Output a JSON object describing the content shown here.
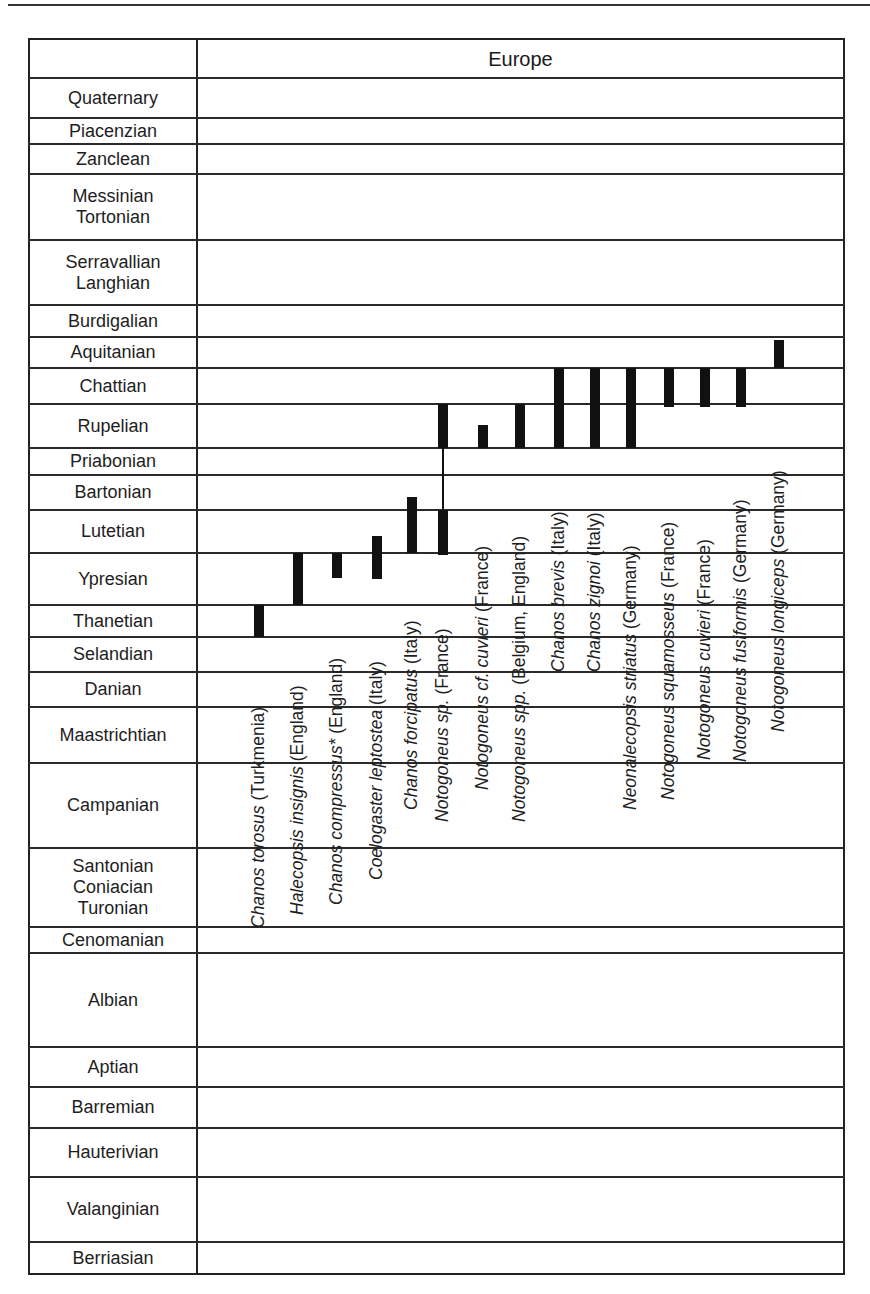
{
  "header": {
    "column_title": "Europe"
  },
  "chart_data": {
    "type": "range-chart",
    "title": "Europe",
    "xlabel": "",
    "ylabel": "Geological stage",
    "region": "Europe",
    "stages": [
      {
        "label": "Quaternary",
        "lines": [
          "Quaternary"
        ],
        "top": 78,
        "bottom": 118
      },
      {
        "label": "Piacenzian",
        "lines": [
          "Piacenzian"
        ],
        "top": 118,
        "bottom": 144
      },
      {
        "label": "Zanclean",
        "lines": [
          "Zanclean"
        ],
        "top": 144,
        "bottom": 174
      },
      {
        "label": "Messinian Tortonian",
        "lines": [
          "Messinian",
          "Tortonian"
        ],
        "top": 174,
        "bottom": 240
      },
      {
        "label": "Serravallian Langhian",
        "lines": [
          "Serravallian",
          "Langhian"
        ],
        "top": 240,
        "bottom": 305
      },
      {
        "label": "Burdigalian",
        "lines": [
          "Burdigalian"
        ],
        "top": 305,
        "bottom": 337
      },
      {
        "label": "Aquitanian",
        "lines": [
          "Aquitanian"
        ],
        "top": 337,
        "bottom": 368
      },
      {
        "label": "Chattian",
        "lines": [
          "Chattian"
        ],
        "top": 368,
        "bottom": 404
      },
      {
        "label": "Rupelian",
        "lines": [
          "Rupelian"
        ],
        "top": 404,
        "bottom": 448
      },
      {
        "label": "Priabonian",
        "lines": [
          "Priabonian"
        ],
        "top": 448,
        "bottom": 475
      },
      {
        "label": "Bartonian",
        "lines": [
          "Bartonian"
        ],
        "top": 475,
        "bottom": 510
      },
      {
        "label": "Lutetian",
        "lines": [
          "Lutetian"
        ],
        "top": 510,
        "bottom": 553
      },
      {
        "label": "Ypresian",
        "lines": [
          "Ypresian"
        ],
        "top": 553,
        "bottom": 605
      },
      {
        "label": "Thanetian",
        "lines": [
          "Thanetian"
        ],
        "top": 605,
        "bottom": 637
      },
      {
        "label": "Selandian",
        "lines": [
          "Selandian"
        ],
        "top": 637,
        "bottom": 672
      },
      {
        "label": "Danian",
        "lines": [
          "Danian"
        ],
        "top": 672,
        "bottom": 707
      },
      {
        "label": "Maastrichtian",
        "lines": [
          "Maastrichtian"
        ],
        "top": 707,
        "bottom": 763
      },
      {
        "label": "Campanian",
        "lines": [
          "Campanian"
        ],
        "top": 763,
        "bottom": 848
      },
      {
        "label": "Santonian Coniacian Turonian",
        "lines": [
          "Santonian",
          "Coniacian",
          "Turonian"
        ],
        "top": 848,
        "bottom": 927
      },
      {
        "label": "Cenomanian",
        "lines": [
          "Cenomanian"
        ],
        "top": 927,
        "bottom": 953
      },
      {
        "label": "Albian",
        "lines": [
          "Albian"
        ],
        "top": 953,
        "bottom": 1047
      },
      {
        "label": "Aptian",
        "lines": [
          "Aptian"
        ],
        "top": 1047,
        "bottom": 1087
      },
      {
        "label": "Barremian",
        "lines": [
          "Barremian"
        ],
        "top": 1087,
        "bottom": 1128
      },
      {
        "label": "Hauterivian",
        "lines": [
          "Hauterivian"
        ],
        "top": 1128,
        "bottom": 1177
      },
      {
        "label": "Valanginian",
        "lines": [
          "Valanginian"
        ],
        "top": 1177,
        "bottom": 1242
      },
      {
        "label": "Berriasian",
        "lines": [
          "Berriasian"
        ],
        "top": 1242,
        "bottom": 1275
      }
    ],
    "series": [
      {
        "name": "Chanos torosus",
        "locality": "(Turkmenia)",
        "range": [
          "Thanetian",
          "Thanetian"
        ],
        "x": 259,
        "segments": [
          [
            605,
            637
          ]
        ],
        "label_bottom": 928
      },
      {
        "name": "Halecopsis insignis",
        "locality": "(England)",
        "range": [
          "Ypresian",
          "Ypresian"
        ],
        "x": 298,
        "segments": [
          [
            553,
            605
          ]
        ],
        "label_bottom": 915
      },
      {
        "name": "Chanos compressus*",
        "locality": "(England)",
        "range": [
          "Ypresian (upper)",
          "Ypresian (upper)"
        ],
        "x": 337,
        "segments": [
          [
            553,
            578
          ]
        ],
        "label_bottom": 905
      },
      {
        "name": "Coelogaster leptostea",
        "locality": "(Italy)",
        "range": [
          "Ypresian",
          "Lutetian (basal)"
        ],
        "x": 377,
        "segments": [
          [
            536,
            579
          ]
        ],
        "label_bottom": 880
      },
      {
        "name": "Chanos forcipatus",
        "locality": "(Italy)",
        "range": [
          "Lutetian",
          "Bartonian (basal)"
        ],
        "x": 412,
        "segments": [
          [
            497,
            553
          ]
        ],
        "label_bottom": 810
      },
      {
        "name": "Notogoneus sp.",
        "locality": "(France)",
        "range": [
          "Lutetian",
          "Rupelian"
        ],
        "x": 443,
        "segments": [
          [
            404,
            448
          ],
          [
            510,
            555
          ]
        ],
        "connector": [
          448,
          510
        ],
        "label_bottom": 822
      },
      {
        "name": "Notogoneus cf. cuvieri",
        "locality": "(France)",
        "range": [
          "Rupelian (lower)",
          "Rupelian (lower)"
        ],
        "x": 483,
        "segments": [
          [
            425,
            448
          ]
        ],
        "label_bottom": 790
      },
      {
        "name": "Notogoneus spp.",
        "locality": "(Belgium, England)",
        "range": [
          "Rupelian",
          "Rupelian"
        ],
        "x": 520,
        "segments": [
          [
            404,
            448
          ]
        ],
        "label_bottom": 822
      },
      {
        "name": "Chanos brevis",
        "locality": "(Italy)",
        "range": [
          "Rupelian",
          "Chattian"
        ],
        "x": 559,
        "segments": [
          [
            368,
            448
          ]
        ],
        "label_bottom": 672
      },
      {
        "name": "Chanos zignoi",
        "locality": "(Italy)",
        "range": [
          "Rupelian",
          "Chattian"
        ],
        "x": 595,
        "segments": [
          [
            368,
            448
          ]
        ],
        "label_bottom": 672
      },
      {
        "name": "Neonalecopsis striatus",
        "locality": "(Germany)",
        "range": [
          "Rupelian",
          "Chattian"
        ],
        "x": 631,
        "segments": [
          [
            368,
            448
          ]
        ],
        "label_bottom": 810
      },
      {
        "name": "Notogoneus squamosseus",
        "locality": "(France)",
        "range": [
          "Chattian",
          "Chattian"
        ],
        "x": 669,
        "segments": [
          [
            368,
            407
          ]
        ],
        "label_bottom": 800
      },
      {
        "name": "Notogoneus cuvieri",
        "locality": "(France)",
        "range": [
          "Chattian",
          "Chattian"
        ],
        "x": 705,
        "segments": [
          [
            368,
            407
          ]
        ],
        "label_bottom": 760
      },
      {
        "name": "Notogoneus fusiformis",
        "locality": "(Germany)",
        "range": [
          "Chattian",
          "Chattian"
        ],
        "x": 741,
        "segments": [
          [
            368,
            407
          ]
        ],
        "label_bottom": 762
      },
      {
        "name": "Notogoneus longiceps",
        "locality": "(Germany)",
        "range": [
          "Aquitanian",
          "Aquitanian"
        ],
        "x": 779,
        "segments": [
          [
            340,
            368
          ]
        ],
        "label_bottom": 732
      }
    ],
    "legend": [],
    "grid": true
  }
}
